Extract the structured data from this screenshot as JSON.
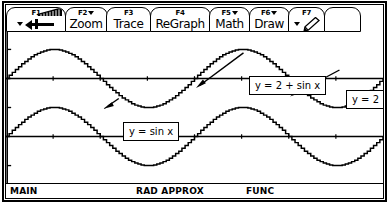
{
  "device": {
    "screen_title": "TI Graphing Calculator Graph Screen"
  },
  "toolbar": {
    "tabs": [
      {
        "fkey": "F1",
        "label": "",
        "icon": "tools-arrow-icon",
        "has_caret": true
      },
      {
        "fkey": "F2",
        "label": "Zoom",
        "icon": "",
        "has_caret": true
      },
      {
        "fkey": "F3",
        "label": "Trace",
        "icon": "",
        "has_caret": false
      },
      {
        "fkey": "F4",
        "label": "ReGraph",
        "icon": "",
        "has_caret": false
      },
      {
        "fkey": "F5",
        "label": "Math",
        "icon": "",
        "has_caret": true
      },
      {
        "fkey": "F6",
        "label": "Draw",
        "icon": "",
        "has_caret": true
      },
      {
        "fkey": "F7",
        "label": "",
        "icon": "pencil-icon",
        "has_caret": true
      },
      {
        "fkey": "",
        "label": "",
        "icon": "",
        "has_caret": false
      }
    ]
  },
  "annotations": [
    {
      "text": "y = 2 + sin x",
      "target": "upper-sine-curve"
    },
    {
      "text": "y = 2",
      "target": "horizontal-line-y2"
    },
    {
      "text": "y = sin x",
      "target": "lower-sine-curve"
    }
  ],
  "statusbar": {
    "mode_main": "MAIN",
    "mode_angle": "RAD APPROX",
    "mode_graph": "FUNC"
  },
  "chart_data": {
    "type": "line",
    "title": "",
    "xlabel": "",
    "ylabel": "",
    "xlim": [
      0,
      12.566370614
    ],
    "ylim": [
      -1.6,
      3.6
    ],
    "grid": false,
    "legend": "annotated-callouts",
    "axes": {
      "x_axis_value": 0,
      "y_axis_shown": true,
      "x_tick_spacing": 1.5707963268,
      "y_tick_spacing": 1
    },
    "series": [
      {
        "name": "y = 2 + sin x",
        "kind": "sine",
        "amplitude": 1,
        "offset": 2,
        "period": 6.283185307,
        "phase": 0,
        "points_per_period": 60
      },
      {
        "name": "y = 2",
        "kind": "constant",
        "value": 2
      },
      {
        "name": "y = sin x",
        "kind": "sine",
        "amplitude": 1,
        "offset": 0,
        "period": 6.283185307,
        "phase": 0,
        "points_per_period": 60
      },
      {
        "name": "x-axis (y = 0)",
        "kind": "constant",
        "value": 0
      }
    ]
  }
}
